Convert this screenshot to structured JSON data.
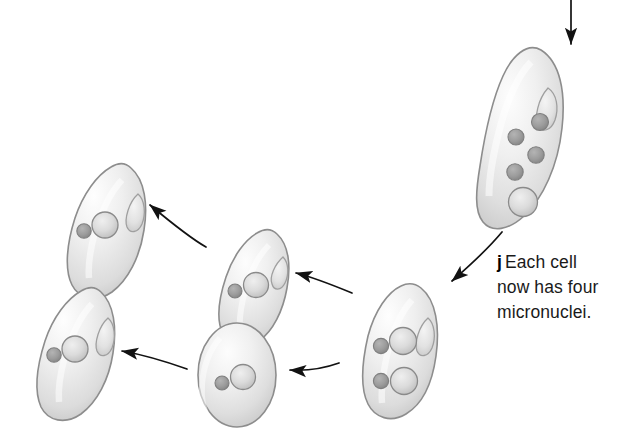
{
  "figure": {
    "background_color": "#ffffff",
    "width": 627,
    "height": 444,
    "style": "grayscale pencil shaded biological illustration"
  },
  "caption": {
    "step_label": "j",
    "line1": "Each cell",
    "line2": "now has four",
    "line3": "micronuclei.",
    "full_text": "j Each cell now has four micronuclei.",
    "text_color": "#1a1a1a"
  },
  "colors": {
    "cell_fill": "#e3e3e3",
    "cell_fill_light": "#f7f7f7",
    "cell_outline": "#8d8d8d",
    "micronucleus": "#9a9a9a",
    "macronucleus": "#cfcfcf",
    "nucleus_outline": "#7f7f7f",
    "arrow": "#121212",
    "oral_groove": "#9f9f9f"
  },
  "cells": [
    {
      "id": "cell-top-right",
      "name": "four-micronuclei-cell",
      "shape": "elongated teardrop",
      "micronuclei_count": 4,
      "macronuclei_count": 1,
      "has_oral_groove": true,
      "note": "Each cell now has four micronuclei."
    },
    {
      "id": "cell-center",
      "name": "two-micronuclei-cell",
      "shape": "elongated teardrop",
      "micronuclei_count": 2,
      "macronuclei_count": 2,
      "has_oral_groove": true
    },
    {
      "id": "cell-upper-middle",
      "name": "single-micronucleus-cell-upper",
      "shape": "teardrop",
      "micronuclei_count": 1,
      "macronuclei_count": 1,
      "has_oral_groove": true
    },
    {
      "id": "cell-upper-left",
      "name": "single-micronucleus-cell-upper-left",
      "shape": "teardrop",
      "micronuclei_count": 1,
      "macronuclei_count": 1,
      "has_oral_groove": true
    },
    {
      "id": "cell-bottom-middle",
      "name": "single-micronucleus-cell-lower-middle",
      "shape": "rounded oval",
      "micronuclei_count": 1,
      "macronuclei_count": 1,
      "has_oral_groove": false
    },
    {
      "id": "cell-bottom-left",
      "name": "single-micronucleus-cell-lower-left",
      "shape": "teardrop",
      "micronuclei_count": 1,
      "macronuclei_count": 1,
      "has_oral_groove": true
    }
  ],
  "arrows": [
    {
      "id": "arrow-incoming-top",
      "direction": "down",
      "from": "off-figure above",
      "to": "cell-top-right"
    },
    {
      "id": "arrow-caption-leader",
      "direction": "down-left",
      "from": "cell-top-right",
      "to": "caption"
    },
    {
      "id": "arrow-center-to-upper-middle",
      "direction": "left",
      "from": "cell-center",
      "to": "cell-upper-middle"
    },
    {
      "id": "arrow-upper-middle-to-upper-left",
      "direction": "up-left",
      "from": "cell-upper-middle",
      "to": "cell-upper-left"
    },
    {
      "id": "arrow-center-to-bottom-middle",
      "direction": "left",
      "from": "cell-center",
      "to": "cell-bottom-middle"
    },
    {
      "id": "arrow-bottom-middle-to-bottom-left",
      "direction": "left",
      "from": "cell-bottom-middle",
      "to": "cell-bottom-left"
    }
  ]
}
